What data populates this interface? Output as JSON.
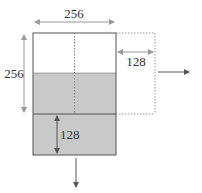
{
  "diagram": {
    "type": "buffer-shift-illustration",
    "colors": {
      "background": "#ffffff",
      "stroke": "#555555",
      "dotted": "#9a9a9a",
      "arrow": "#555555",
      "shaded_fill": "#c9c9c9",
      "text": "#333333"
    },
    "labels": {
      "top_width": "256",
      "left_height": "256",
      "right_shift": "128",
      "bottom_shift": "128"
    },
    "regions": [
      {
        "name": "top-white-region",
        "shaded": false
      },
      {
        "name": "middle-gray-region",
        "shaded": true
      },
      {
        "name": "bottom-gray-region",
        "shaded": true
      },
      {
        "name": "right-dotted-extension",
        "shaded": false,
        "dotted": true
      }
    ],
    "arrows": [
      {
        "name": "width-dimension-arrow",
        "direction": "both",
        "label": "256"
      },
      {
        "name": "height-dimension-arrow",
        "direction": "both",
        "label": "256"
      },
      {
        "name": "right-shift-dimension-arrow",
        "direction": "both",
        "label": "128"
      },
      {
        "name": "down-shift-dimension-arrow",
        "direction": "both",
        "label": "128"
      },
      {
        "name": "move-right-arrow",
        "direction": "right"
      },
      {
        "name": "move-down-arrow",
        "direction": "down"
      }
    ]
  }
}
